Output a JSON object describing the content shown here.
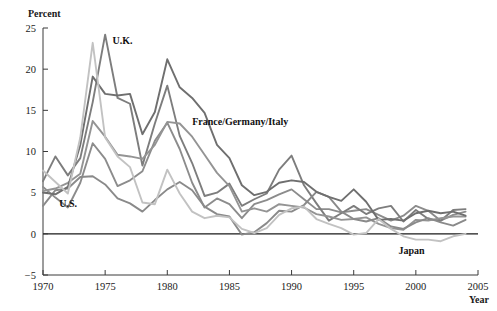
{
  "chart_data": {
    "type": "line",
    "title": "",
    "subtitle": "",
    "xlabel": "Year",
    "ylabel": "Percent",
    "xlim": [
      1970,
      2005
    ],
    "ylim": [
      -5,
      25
    ],
    "xticks": [
      1970,
      1975,
      1980,
      1985,
      1990,
      1995,
      2000,
      2005
    ],
    "xticklabels": [
      "1970",
      "1975",
      "1980",
      "1985",
      "1990",
      "1995",
      "2000",
      "2005"
    ],
    "yticks": [
      -5,
      0,
      5,
      10,
      15,
      20,
      25
    ],
    "yticklabels": [
      "−5",
      "0",
      "5",
      "10",
      "15",
      "20",
      "25"
    ],
    "grid": false,
    "legend": "inline-annotations",
    "zero_reference_line": 0,
    "x": [
      1970,
      1971,
      1972,
      1973,
      1974,
      1975,
      1976,
      1977,
      1978,
      1979,
      1980,
      1981,
      1982,
      1983,
      1984,
      1985,
      1986,
      1987,
      1988,
      1989,
      1990,
      1991,
      1992,
      1993,
      1994,
      1995,
      1996,
      1997,
      1998,
      1999,
      2000,
      2001,
      2002,
      2003,
      2004
    ],
    "series": [
      {
        "name": "U.S.",
        "color": "#8c8c8c",
        "values": [
          5.7,
          4.4,
          3.2,
          6.2,
          11.0,
          9.1,
          5.8,
          6.5,
          7.6,
          11.3,
          13.5,
          10.3,
          6.2,
          3.2,
          4.3,
          3.6,
          1.9,
          3.6,
          4.1,
          4.8,
          5.4,
          4.2,
          3.0,
          3.0,
          2.6,
          2.8,
          3.0,
          2.3,
          1.6,
          2.2,
          3.4,
          2.8,
          1.6,
          2.3,
          2.7
        ]
      },
      {
        "name": "U.K.",
        "color": "#7d7d7d",
        "values": [
          6.4,
          9.4,
          7.1,
          9.2,
          16.0,
          24.2,
          16.5,
          15.8,
          8.3,
          13.4,
          18.0,
          11.9,
          8.6,
          4.6,
          5.0,
          6.1,
          3.4,
          4.2,
          4.9,
          7.8,
          9.5,
          5.9,
          3.7,
          1.6,
          2.5,
          3.4,
          2.4,
          3.1,
          3.4,
          1.5,
          2.9,
          1.8,
          1.6,
          2.9,
          3.0
        ]
      },
      {
        "name": "France",
        "color": "#949494",
        "values": [
          5.2,
          5.5,
          6.2,
          7.3,
          13.7,
          11.8,
          9.6,
          9.4,
          9.1,
          10.8,
          13.6,
          13.4,
          11.8,
          9.6,
          7.4,
          5.8,
          2.7,
          3.1,
          2.7,
          3.6,
          3.4,
          3.2,
          2.4,
          2.1,
          1.7,
          1.8,
          2.0,
          1.2,
          0.7,
          0.5,
          1.7,
          1.6,
          1.9,
          2.1,
          2.1
        ]
      },
      {
        "name": "Germany",
        "color": "#8a8a8a",
        "values": [
          3.4,
          5.3,
          5.5,
          6.9,
          7.0,
          6.0,
          4.3,
          3.7,
          2.7,
          4.1,
          5.4,
          6.3,
          5.3,
          3.3,
          2.4,
          2.1,
          -0.1,
          0.2,
          1.3,
          2.8,
          2.7,
          3.5,
          5.1,
          4.5,
          2.7,
          1.8,
          1.5,
          1.9,
          0.9,
          0.6,
          1.4,
          1.9,
          1.4,
          1.0,
          1.7
        ]
      },
      {
        "name": "Italy",
        "color": "#6f6f6f",
        "values": [
          5.0,
          4.8,
          5.7,
          10.8,
          19.1,
          17.0,
          16.8,
          17.0,
          12.1,
          14.8,
          21.2,
          17.8,
          16.5,
          14.7,
          10.8,
          9.2,
          5.9,
          4.7,
          5.1,
          6.2,
          6.5,
          6.3,
          5.1,
          4.5,
          4.0,
          5.4,
          3.9,
          1.7,
          1.8,
          1.6,
          2.5,
          2.8,
          2.5,
          2.7,
          2.2
        ]
      },
      {
        "name": "Japan",
        "color": "#c2c2c2",
        "values": [
          7.7,
          6.3,
          4.9,
          11.7,
          23.2,
          11.7,
          9.4,
          8.1,
          3.8,
          3.6,
          7.8,
          4.9,
          2.7,
          1.9,
          2.2,
          2.0,
          0.6,
          0.1,
          0.7,
          2.3,
          3.1,
          3.3,
          1.8,
          1.2,
          0.7,
          -0.1,
          0.1,
          1.8,
          0.6,
          -0.3,
          -0.7,
          -0.7,
          -0.9,
          -0.3,
          0.0
        ]
      }
    ],
    "annotations": [
      {
        "text": "U.K.",
        "x": 1975.6,
        "y": 23.0
      },
      {
        "text": "U.S.",
        "x": 1971.3,
        "y": 3.2
      },
      {
        "text": "France/Germany/Italy",
        "x": 1982.0,
        "y": 13.2
      },
      {
        "text": "Japan",
        "x": 1998.6,
        "y": -2.4
      }
    ]
  },
  "axis": {
    "y_title": "Percent",
    "x_title": "Year"
  }
}
